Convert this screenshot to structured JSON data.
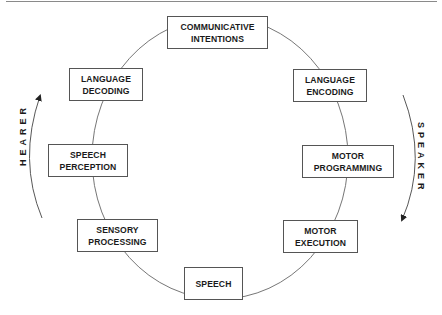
{
  "diagram": {
    "title": "",
    "colors": {
      "stroke": "#555555",
      "text": "#1a1a1a",
      "background": "#ffffff"
    },
    "nodes": [
      {
        "id": "communicative-intentions",
        "lines": [
          "COMMUNICATIVE",
          "INTENTIONS"
        ]
      },
      {
        "id": "language-encoding",
        "lines": [
          "LANGUAGE",
          "ENCODING"
        ]
      },
      {
        "id": "motor-programming",
        "lines": [
          "MOTOR",
          "PROGRAMMING"
        ]
      },
      {
        "id": "motor-execution",
        "lines": [
          "MOTOR",
          "EXECUTION"
        ]
      },
      {
        "id": "speech",
        "lines": [
          "SPEECH"
        ]
      },
      {
        "id": "sensory-processing",
        "lines": [
          "SENSORY",
          "PROCESSING"
        ]
      },
      {
        "id": "speech-perception",
        "lines": [
          "SPEECH",
          "PERCEPTION"
        ]
      },
      {
        "id": "language-decoding",
        "lines": [
          "LANGUAGE",
          "DECODING"
        ]
      }
    ],
    "cycle_order": [
      "communicative-intentions",
      "language-encoding",
      "motor-programming",
      "motor-execution",
      "speech",
      "sensory-processing",
      "speech-perception",
      "language-decoding"
    ],
    "side_labels": {
      "hearer": "HEARER",
      "speaker": "SPEAKER"
    },
    "arrows": {
      "hearer": "upward arc on left side (bottom to top)",
      "speaker": "downward arc on right side (top to bottom)"
    }
  }
}
